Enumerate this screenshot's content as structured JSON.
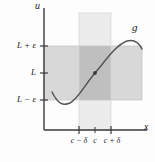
{
  "figure": {
    "type": "epsilon-delta-limit-diagram",
    "axes": {
      "y_axis_label": "u",
      "x_axis_label": "x",
      "origin_px": [
        44,
        130
      ]
    },
    "curve": {
      "name": "g",
      "color": "#555555",
      "description": "S-shaped curve passing through (c, L)"
    },
    "y_ticks": [
      {
        "label_prefix": "L",
        "op": "+",
        "sym": "ε",
        "y_px": 46
      },
      {
        "label_prefix": "L",
        "op": "",
        "sym": "",
        "y_px": 73
      },
      {
        "label_prefix": "L",
        "op": "−",
        "sym": "ε",
        "y_px": 100
      }
    ],
    "y_tick_labels": [
      "L + ε",
      "L",
      "L − ε"
    ],
    "x_ticks": [
      {
        "label": "c − δ",
        "x_px": 79
      },
      {
        "label": "c",
        "x_px": 95
      },
      {
        "label": "c + δ",
        "x_px": 111
      }
    ],
    "x_tick_labels": [
      "c − δ",
      "c",
      "c + δ"
    ],
    "bands": {
      "epsilon_band": {
        "fill": "#d8d8d8",
        "y_top_px": 46,
        "y_bottom_px": 100,
        "x_left_px": 44,
        "x_right_px": 142
      },
      "delta_band": {
        "fill": "#ececec",
        "x_left_px": 79,
        "x_right_px": 111,
        "y_top_px": 13,
        "y_bottom_px": 130
      },
      "overlap": {
        "fill": "#bfbfbf"
      }
    },
    "point": {
      "label": "",
      "x_px": 95,
      "y_px": 73,
      "color": "#3a3a3a"
    },
    "colors": {
      "axis": "#3a3a3a",
      "curve": "#555555",
      "text": "#1a1a1a",
      "background": "#fdfdfd"
    }
  }
}
